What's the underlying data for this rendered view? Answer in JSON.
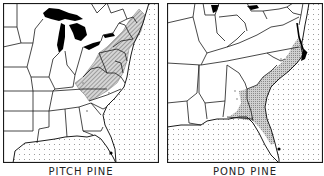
{
  "maps": [
    {
      "id": "left",
      "title": "PITCH PINE",
      "range_pattern": "hatched",
      "region": "Eastern United States",
      "range_description": "Appalachian and northeastern range from Maine through New England, New York, Pennsylvania, New Jersey, south along the Appalachians into Virginia, West Virginia, Kentucky, Tennessee, North Carolina, South Carolina and Georgia; outlier in Florida"
    },
    {
      "id": "right",
      "title": "POND PINE",
      "range_pattern": "stippled",
      "region": "Southeastern United States",
      "range_description": "Atlantic and Gulf coastal plain from southern New Jersey/Delaware through Virginia, North Carolina, South Carolina, Georgia and northern Florida; outliers in Alabama and southern Florida"
    }
  ],
  "colors": {
    "background": "#ffffff",
    "outline": "#1a1a1a",
    "lakes": "#000000",
    "ocean_dots": "#8a8a8a",
    "range_fill": "#bdbdbd"
  }
}
